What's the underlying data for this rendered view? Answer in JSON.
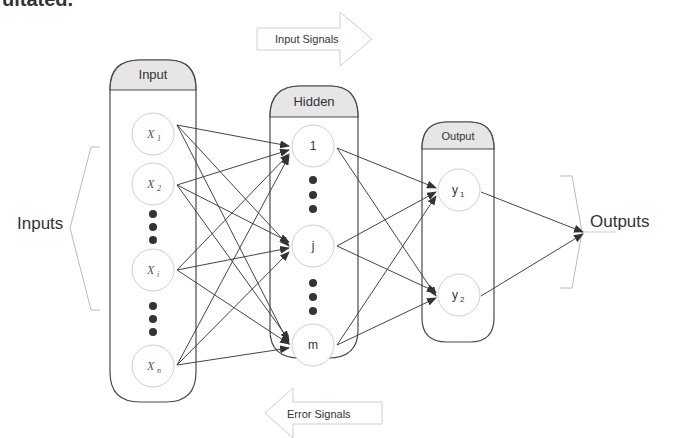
{
  "top_cut_text": "ultated.",
  "signals": {
    "input": "Input Signals",
    "error": "Error Signals"
  },
  "side_labels": {
    "inputs": "Inputs",
    "outputs": "Outputs"
  },
  "layers": {
    "input": {
      "title": "Input",
      "nodes": [
        {
          "base": "X",
          "sub": "1"
        },
        {
          "base": "X",
          "sub": "2"
        },
        {
          "base": "X",
          "sub": "i"
        },
        {
          "base": "X",
          "sub": "n"
        }
      ]
    },
    "hidden": {
      "title": "Hidden",
      "nodes": [
        "1",
        "j",
        "m"
      ]
    },
    "output": {
      "title": "Output",
      "nodes": [
        {
          "base": "y",
          "sub": "1"
        },
        {
          "base": "y",
          "sub": "2"
        }
      ]
    }
  },
  "colors": {
    "frame": "#4a4a4a",
    "header_fill": "#e6e6e6",
    "node_stroke": "#cfcfcf",
    "edge": "#444444",
    "dot": "#333333",
    "arrow_outline": "#cfcfcf"
  }
}
